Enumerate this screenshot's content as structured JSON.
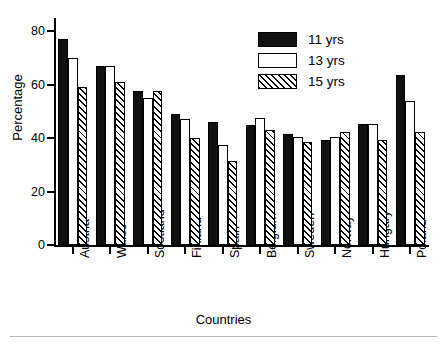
{
  "chart_data": {
    "type": "bar",
    "title": "",
    "xlabel": "Countries",
    "ylabel": "Percentage",
    "ylim": [
      0,
      85
    ],
    "yticks": [
      0,
      20,
      40,
      60,
      80
    ],
    "ytick_labels": [
      "0",
      "20",
      "40",
      "60",
      "80"
    ],
    "grid": false,
    "legend_position": "top-right",
    "categories": [
      "Austria",
      "Wales",
      "Scotland",
      "Finland",
      "Spain",
      "Belgium",
      "Sweden",
      "Norway",
      "Hungary",
      "Poland"
    ],
    "series": [
      {
        "name": "11 yrs",
        "style": "solid-black",
        "values": [
          77,
          67,
          57.5,
          49,
          46,
          45,
          41.5,
          39.5,
          45.5,
          63.5
        ]
      },
      {
        "name": "13 yrs",
        "style": "open-white",
        "values": [
          70,
          67,
          55,
          47,
          37.5,
          47.5,
          40.5,
          40.5,
          45.5,
          54
        ]
      },
      {
        "name": "15 yrs",
        "style": "diagonal-hatch",
        "values": [
          59,
          61,
          57.5,
          40,
          31.5,
          43,
          38.5,
          42.5,
          39.5,
          42.5
        ]
      }
    ]
  },
  "legend": {
    "items": [
      {
        "label": "11 yrs"
      },
      {
        "label": "13 yrs"
      },
      {
        "label": "15 yrs"
      }
    ]
  },
  "colors": {
    "series_11yrs": "#111111",
    "series_13yrs": "#ffffff",
    "series_15yrs": "#ffffff",
    "axis": "#000000",
    "background": "#ffffff",
    "rule": "#b9b9b9"
  }
}
